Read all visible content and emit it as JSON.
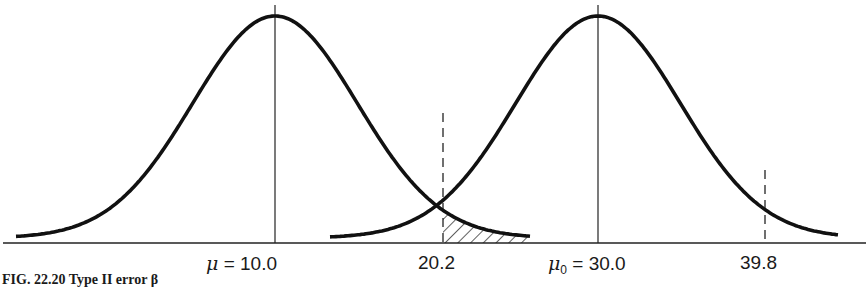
{
  "chart_data": {
    "type": "area",
    "title": "",
    "caption": "FIG. 22.20   Type II error β",
    "xlabel": "",
    "ylabel": "",
    "grid": false,
    "legend": null,
    "series": [
      {
        "name": "Sampling distribution under true mean",
        "distribution": "normal",
        "mean": 10.0,
        "sd": 5.1,
        "label": "μ = 10.0"
      },
      {
        "name": "Sampling distribution under hypothesized mean",
        "distribution": "normal",
        "mean": 30.0,
        "sd": 5.1,
        "label": "μ₀ = 30.0"
      }
    ],
    "critical_values": [
      20.2,
      39.8
    ],
    "shaded_region": {
      "under": "μ = 10.0 curve",
      "from": 20.2,
      "to": "right tail",
      "style": "hatched",
      "meaning": "β (Type II error)"
    },
    "x_tick_labels": [
      {
        "value": 10.0,
        "text": "μ = 10.0"
      },
      {
        "value": 20.2,
        "text": "20.2"
      },
      {
        "value": 30.0,
        "text": "μ₀ = 30.0"
      },
      {
        "value": 39.8,
        "text": "39.8"
      }
    ]
  },
  "labels": {
    "mu_symbol": "μ",
    "mu_value": " = 10.0",
    "mu0_symbol": "μ",
    "mu0_sub": "0",
    "mu0_value": " = 30.0",
    "crit_low": "20.2",
    "crit_high": "39.8",
    "caption": "FIG. 22.20   Type II error β"
  }
}
